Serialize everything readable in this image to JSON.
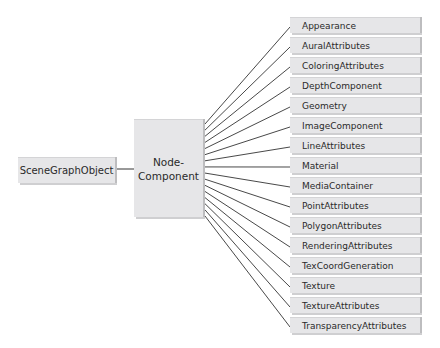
{
  "root": {
    "label": "SceneGraphObject"
  },
  "node": {
    "line1": "Node-",
    "line2": "Component"
  },
  "children": [
    {
      "label": "Appearance"
    },
    {
      "label": "AuralAttributes"
    },
    {
      "label": "ColoringAttributes"
    },
    {
      "label": "DepthComponent"
    },
    {
      "label": "Geometry"
    },
    {
      "label": "ImageComponent"
    },
    {
      "label": "LineAttributes"
    },
    {
      "label": "Material"
    },
    {
      "label": "MediaContainer"
    },
    {
      "label": "PointAttributes"
    },
    {
      "label": "PolygonAttributes"
    },
    {
      "label": "RenderingAttributes"
    },
    {
      "label": "TexCoordGeneration"
    },
    {
      "label": "Texture"
    },
    {
      "label": "TextureAttributes"
    },
    {
      "label": "TransparencyAttributes"
    }
  ]
}
